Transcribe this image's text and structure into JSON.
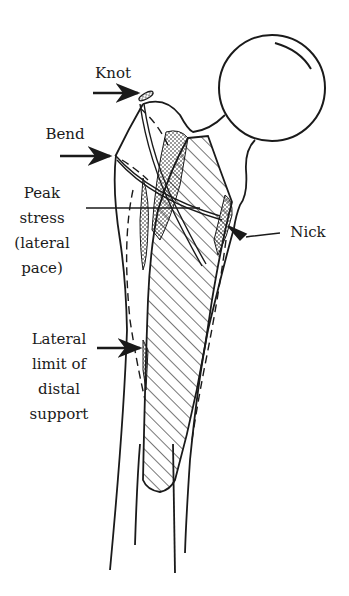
{
  "figure": {
    "stroke_color": "#1a1a1a",
    "background_color": "#ffffff"
  },
  "labels": {
    "knot": "Knot",
    "bend": "Bend",
    "peak_stress": "Peak\nstress\n(lateral\npace)",
    "nick": "Nick",
    "lateral_limit": "Lateral\nlimit of\ndistal\nsupport"
  }
}
